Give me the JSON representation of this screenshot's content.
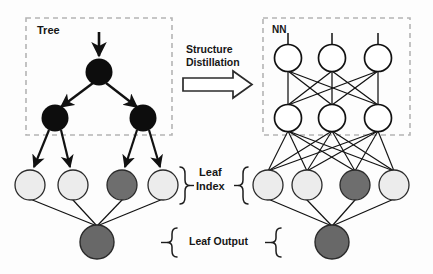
{
  "figure": {
    "type": "diagram",
    "title_labels": {
      "tree_box": "Tree",
      "nn_box": "NN",
      "transform_line1": "Structure",
      "transform_line2": "Distillation",
      "leaf_index": "Leaf\nIndex",
      "leaf_index_line1": "Leaf",
      "leaf_index_line2": "Index",
      "leaf_output": "Leaf Output"
    },
    "colors": {
      "background": "#fdfdfd",
      "stroke": "#1a1a1a",
      "node_filled": "#0d0d0d",
      "node_hollow": "#ffffff",
      "leaf_light": "#ececec",
      "leaf_highlight": "#6e6e6e",
      "output_node": "#686868",
      "dashed_box": "#b4b4b4",
      "text": "#161616"
    },
    "left_panel": {
      "name": "tree",
      "dashed_box": {
        "x": 26,
        "y": 18,
        "w": 146,
        "h": 117
      },
      "input_arrow": {
        "from_x": 99,
        "from_y": 33,
        "to_x": 99,
        "to_y": 57
      },
      "nodes": [
        {
          "id": "root",
          "x": 99,
          "y": 72,
          "r": 13.5,
          "fill": "#0d0d0d",
          "role": "internal"
        },
        {
          "id": "left",
          "x": 55,
          "y": 118,
          "r": 13.5,
          "fill": "#0d0d0d",
          "role": "internal"
        },
        {
          "id": "right",
          "x": 143,
          "y": 118,
          "r": 13.5,
          "fill": "#0d0d0d",
          "role": "internal"
        }
      ],
      "leaf_nodes": [
        {
          "id": "leaf0",
          "x": 30,
          "y": 185,
          "r": 15,
          "fill": "#ececec",
          "role": "leaf"
        },
        {
          "id": "leaf1",
          "x": 73,
          "y": 185,
          "r": 15,
          "fill": "#ececec",
          "role": "leaf"
        },
        {
          "id": "leaf2",
          "x": 122,
          "y": 185,
          "r": 15,
          "fill": "#6e6e6e",
          "role": "leaf-selected"
        },
        {
          "id": "leaf3",
          "x": 163,
          "y": 185,
          "r": 15,
          "fill": "#ececec",
          "role": "leaf"
        }
      ],
      "output_node": {
        "id": "output",
        "x": 97,
        "y": 242,
        "r": 17,
        "fill": "#686868",
        "role": "output"
      },
      "tree_edges": [
        {
          "from": "root",
          "to": "left"
        },
        {
          "from": "root",
          "to": "right"
        },
        {
          "from": "left",
          "to": "leaf0"
        },
        {
          "from": "left",
          "to": "leaf1"
        },
        {
          "from": "right",
          "to": "leaf2"
        },
        {
          "from": "right",
          "to": "leaf3"
        }
      ]
    },
    "right_panel": {
      "name": "neural-network",
      "dashed_box": {
        "x": 263,
        "y": 18,
        "w": 147,
        "h": 117
      },
      "input_stubs_y": 36,
      "hidden_layer_1": [
        {
          "id": "h1a",
          "x": 288,
          "y": 58,
          "r": 13.5,
          "fill": "#ffffff"
        },
        {
          "id": "h1b",
          "x": 332,
          "y": 58,
          "r": 13.5,
          "fill": "#ffffff"
        },
        {
          "id": "h1c",
          "x": 378,
          "y": 58,
          "r": 13.5,
          "fill": "#ffffff"
        }
      ],
      "hidden_layer_2": [
        {
          "id": "h2a",
          "x": 288,
          "y": 118,
          "r": 13.5,
          "fill": "#ffffff"
        },
        {
          "id": "h2b",
          "x": 332,
          "y": 118,
          "r": 13.5,
          "fill": "#ffffff"
        },
        {
          "id": "h2c",
          "x": 378,
          "y": 118,
          "r": 13.5,
          "fill": "#ffffff"
        }
      ],
      "leaf_nodes": [
        {
          "id": "rleaf0",
          "x": 268,
          "y": 185,
          "r": 15,
          "fill": "#ececec"
        },
        {
          "id": "rleaf1",
          "x": 307,
          "y": 185,
          "r": 15,
          "fill": "#ececec"
        },
        {
          "id": "rleaf2",
          "x": 355,
          "y": 185,
          "r": 15,
          "fill": "#6e6e6e"
        },
        {
          "id": "rleaf3",
          "x": 394,
          "y": 185,
          "r": 15,
          "fill": "#ececec"
        }
      ],
      "output_node": {
        "id": "routput",
        "x": 332,
        "y": 242,
        "r": 17,
        "fill": "#686868"
      }
    },
    "arrow": {
      "name": "structure-distillation-arrow",
      "x": 183,
      "y": 75,
      "w": 70,
      "h": 22,
      "direction": "right"
    },
    "braces": [
      {
        "name": "leaf-index-left-brace",
        "x": 182,
        "y": 167,
        "h": 38,
        "facing": "left"
      },
      {
        "name": "leaf-index-right-brace",
        "x": 243,
        "y": 167,
        "h": 38,
        "facing": "right"
      },
      {
        "name": "leaf-output-left-brace",
        "x": 163,
        "y": 228,
        "h": 30,
        "facing": "left"
      },
      {
        "name": "leaf-output-right-brace",
        "x": 276,
        "y": 228,
        "h": 30,
        "facing": "right"
      }
    ]
  }
}
